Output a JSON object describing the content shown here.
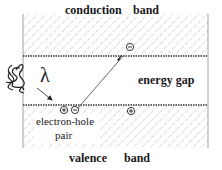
{
  "diagram": {
    "type": "band-diagram",
    "labels": {
      "conduction_band_word1": "conduction",
      "conduction_band_word2": "band",
      "energy_gap": "energy gap",
      "valence_band_word1": "valence",
      "valence_band_word2": "band",
      "electron_hole_line1": "electron-hole",
      "electron_hole_line2": "pair",
      "photon_symbol": "λ"
    },
    "charges": {
      "excited_electron": "⊖",
      "pair_hole": "⊕",
      "pair_electron": "⊖",
      "free_hole": "⊕"
    },
    "colors": {
      "line": "#333333",
      "hatch": "#9a9a9a",
      "text": "#1a1a1a",
      "background": "#ffffff"
    }
  }
}
